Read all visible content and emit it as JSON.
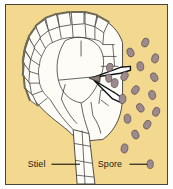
{
  "figure": {
    "background_color": "#f3d88f",
    "border_color": "#4a4436",
    "cell_fill_color": "#fdfcf7",
    "cell_outline_color": "#3a3a3a",
    "cell_shade_color": "#6f6a55",
    "spore_fill_color": "#9d8a8f",
    "spore_outline_color": "#5b4f50",
    "leader_line_color": "#111111",
    "labels": [
      {
        "id": "stiel",
        "text": "Stiel",
        "x": 22,
        "y": 164,
        "leader": {
          "x1": 46,
          "y1": 161,
          "x2": 75,
          "y2": 161
        }
      },
      {
        "id": "spore",
        "text": "Spore",
        "x": 93,
        "y": 164,
        "leader": {
          "x1": 125,
          "y1": 161,
          "x2": 146,
          "y2": 161
        }
      }
    ],
    "spores": [
      {
        "cx": 141,
        "cy": 38,
        "rx": 3.4,
        "ry": 4.6,
        "rot": 20
      },
      {
        "cx": 126,
        "cy": 48,
        "rx": 3.4,
        "ry": 4.6,
        "rot": -20
      },
      {
        "cx": 151,
        "cy": 54,
        "rx": 3.4,
        "ry": 4.6,
        "rot": 15
      },
      {
        "cx": 136,
        "cy": 62,
        "rx": 3.4,
        "ry": 4.6,
        "rot": -10
      },
      {
        "cx": 120,
        "cy": 72,
        "rx": 3.4,
        "ry": 4.6,
        "rot": 25
      },
      {
        "cx": 150,
        "cy": 73,
        "rx": 3.4,
        "ry": 4.6,
        "rot": -25
      },
      {
        "cx": 110,
        "cy": 79,
        "rx": 3.4,
        "ry": 4.6,
        "rot": 10
      },
      {
        "cx": 131,
        "cy": 86,
        "rx": 3.4,
        "ry": 4.6,
        "rot": 30
      },
      {
        "cx": 148,
        "cy": 91,
        "rx": 3.4,
        "ry": 4.6,
        "rot": -15
      },
      {
        "cx": 118,
        "cy": 95,
        "rx": 3.4,
        "ry": 4.6,
        "rot": 5
      },
      {
        "cx": 136,
        "cy": 104,
        "rx": 3.4,
        "ry": 4.6,
        "rot": -30
      },
      {
        "cx": 152,
        "cy": 108,
        "rx": 3.4,
        "ry": 4.6,
        "rot": 20
      },
      {
        "cx": 123,
        "cy": 115,
        "rx": 3.4,
        "ry": 4.6,
        "rot": -5
      },
      {
        "cx": 143,
        "cy": 121,
        "rx": 3.4,
        "ry": 4.6,
        "rot": 25
      },
      {
        "cx": 131,
        "cy": 131,
        "rx": 3.4,
        "ry": 4.6,
        "rot": -20
      },
      {
        "cx": 120,
        "cy": 145,
        "rx": 3.4,
        "ry": 4.6,
        "rot": 10
      },
      {
        "cx": 146,
        "cy": 161,
        "rx": 3.2,
        "ry": 4.4,
        "rot": 0
      },
      {
        "cx": 105,
        "cy": 63,
        "rx": 3.2,
        "ry": 4.2,
        "rot": 15
      },
      {
        "cx": 104,
        "cy": 74,
        "rx": 3.2,
        "ry": 4.2,
        "rot": -10
      }
    ]
  }
}
